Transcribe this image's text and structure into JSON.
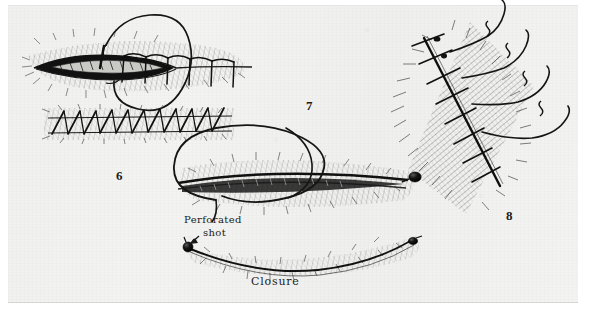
{
  "plate": {
    "kind": "surgical-illustration-plate",
    "caption_bottom": "Closure",
    "paper_color": "#f3f3f1",
    "ink_color": "#1b1b1b",
    "page_background": "#ffffff"
  },
  "figures": [
    {
      "number": "6",
      "x": 121,
      "y": 176,
      "title": "Interrupted sutures and continuous blanket stitch",
      "parts": [
        "open wound with everted edges",
        "interrupted sutures closing right half",
        "threaded needle with loop of suture",
        "continuous blanket stitch row"
      ]
    },
    {
      "number": "7",
      "x": 311,
      "y": 106,
      "title": "Suture loop drawn through wound with perforated shot",
      "parts": [
        "closed wound",
        "large loop of suture",
        "perforated shot bead at wound end"
      ]
    },
    {
      "number": "8",
      "x": 511,
      "y": 216,
      "title": "Diagonal sutured wound with trailing suture ends",
      "parts": [
        "diagonal wound line",
        "cross sutures",
        "four long trailing suture tails"
      ]
    }
  ],
  "annotations": [
    {
      "id": "perforated-shot",
      "line1": "Perforated",
      "line2": "shot",
      "x": 184,
      "y": 214,
      "arrow": {
        "from_x": 199,
        "from_y": 236,
        "to_x": 189,
        "to_y": 245
      }
    },
    {
      "id": "closure",
      "text": "Closure",
      "x": 251,
      "y": 281
    }
  ],
  "shot_beads": [
    {
      "id": "shot-fig7",
      "cx": 415,
      "cy": 177,
      "rx": 6.2,
      "ry": 5.0
    },
    {
      "id": "shot-closure-left",
      "cx": 188,
      "cy": 247,
      "rx": 5.0,
      "ry": 5.0
    },
    {
      "id": "shot-closure-right",
      "cx": 413,
      "cy": 241,
      "rx": 4.6,
      "ry": 3.6
    }
  ]
}
